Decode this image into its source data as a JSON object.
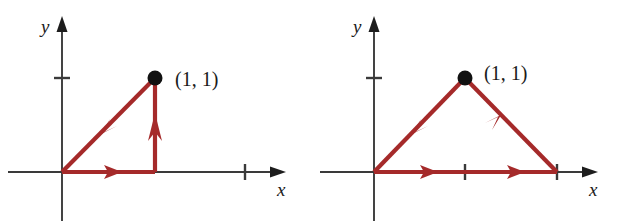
{
  "figure": {
    "name": "two-path-integral-diagrams",
    "background_color": "#ffffff",
    "curve_color": "#a52a2a",
    "axis_color": "#3a3a3a",
    "dot_color": "#111111"
  },
  "panels": [
    {
      "id": "left",
      "name": "left-path-diagram",
      "x_axis_label": "x",
      "y_axis_label": "y",
      "point_label": "(1, 1)",
      "description": "Closed triangular path: origin to (1,0) to (1,1) to origin",
      "origin_px": [
        62,
        172
      ],
      "unit_px": 92,
      "x_ticks": [
        1,
        2
      ],
      "y_ticks": [
        1
      ],
      "vertices": [
        [
          0,
          0
        ],
        [
          1,
          0
        ],
        [
          1,
          1
        ]
      ],
      "marked_point": [
        1,
        1
      ],
      "segments": [
        {
          "name": "bottom-segment",
          "from": [
            0,
            0
          ],
          "to": [
            1,
            0
          ],
          "arrow_direction": "right",
          "arrow_at": 0.42
        },
        {
          "name": "right-vertical-segment",
          "from": [
            1,
            0
          ],
          "to": [
            1,
            1
          ],
          "arrow_direction": "up",
          "arrow_at": 0.52
        },
        {
          "name": "diagonal-segment",
          "from": [
            1,
            1
          ],
          "to": [
            0,
            0
          ],
          "arrow_direction": "down-left",
          "arrow_at": 0.48
        }
      ]
    },
    {
      "id": "right",
      "name": "right-path-diagram",
      "x_axis_label": "x",
      "y_axis_label": "y",
      "point_label": "(1, 1)",
      "description": "Closed triangular path: origin to (2,0) to (1,1) to origin",
      "origin_px": [
        63,
        172
      ],
      "unit_px": 91,
      "x_ticks": [
        1,
        2
      ],
      "y_ticks": [
        1
      ],
      "vertices": [
        [
          0,
          0
        ],
        [
          2,
          0
        ],
        [
          1,
          1
        ]
      ],
      "marked_point": [
        1,
        1
      ],
      "segments": [
        {
          "name": "bottom-segment-first",
          "from": [
            0,
            0
          ],
          "to": [
            1,
            0
          ],
          "arrow_direction": "right",
          "arrow_at": 0.52
        },
        {
          "name": "bottom-segment-second",
          "from": [
            1,
            0
          ],
          "to": [
            2,
            0
          ],
          "arrow_direction": "right",
          "arrow_at": 0.48
        },
        {
          "name": "right-diagonal-segment",
          "from": [
            2,
            0
          ],
          "to": [
            1,
            1
          ],
          "arrow_direction": "up-left",
          "arrow_at": 0.48
        },
        {
          "name": "left-diagonal-segment",
          "from": [
            1,
            1
          ],
          "to": [
            0,
            0
          ],
          "arrow_direction": "down-left",
          "arrow_at": 0.48
        }
      ]
    }
  ]
}
